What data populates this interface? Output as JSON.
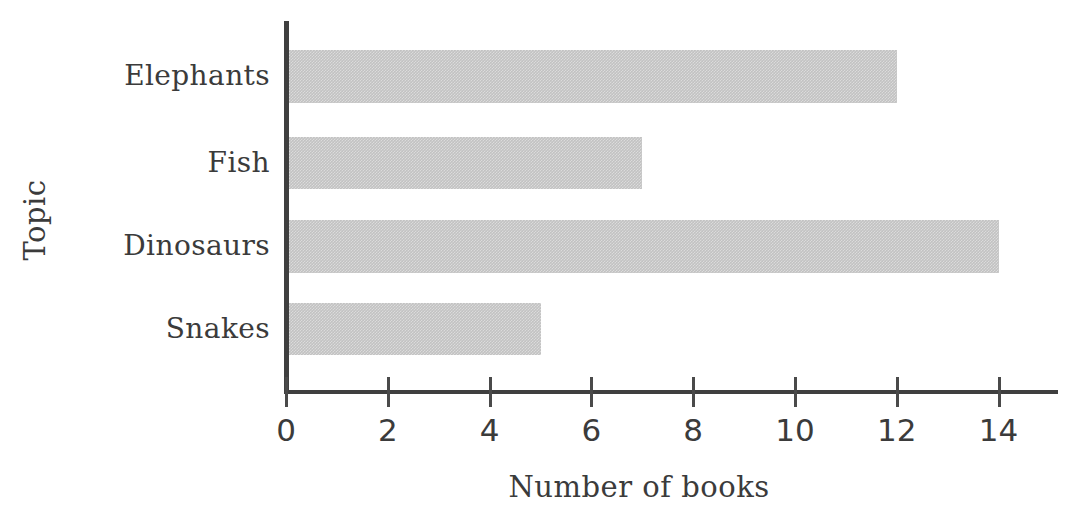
{
  "chart_data": {
    "type": "bar",
    "orientation": "horizontal",
    "title": "",
    "xlabel": "Number of books",
    "ylabel": "Topic",
    "categories": [
      "Elephants",
      "Fish",
      "Dinosaurs",
      "Snakes"
    ],
    "values": [
      12,
      7,
      14,
      5
    ],
    "xlim": [
      0,
      15.2
    ],
    "xticks": [
      0,
      2,
      4,
      6,
      8,
      10,
      12,
      14
    ],
    "xtick_labels": [
      "0",
      "2",
      "4",
      "6",
      "8",
      "10",
      "12",
      "14"
    ],
    "grid": false,
    "legend": null,
    "bar_color": "#c2c2c2",
    "axis_color": "#3f3f3f",
    "text_color": "#3b3b3b",
    "background": "#ffffff"
  },
  "layout": {
    "plot_left_px": 286,
    "px_per_unit": 50.9,
    "baseline_y_px": 390,
    "bars": [
      {
        "top": 50,
        "height": 53
      },
      {
        "top": 137,
        "height": 52
      },
      {
        "top": 220,
        "height": 53
      },
      {
        "top": 303,
        "height": 52
      }
    ],
    "label_tops": [
      62,
      149,
      232,
      315
    ]
  }
}
